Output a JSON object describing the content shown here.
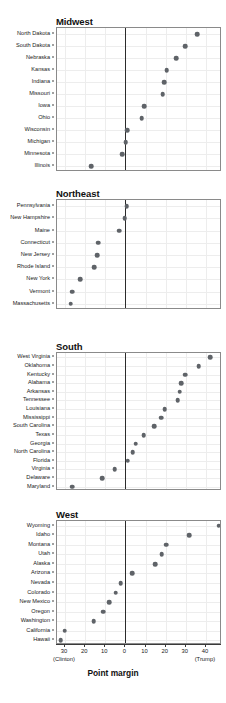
{
  "chart_data": {
    "type": "scatter",
    "title": "",
    "xlabel": "Point margin",
    "ylabel": "",
    "xlim": [
      -34,
      48
    ],
    "xticks": [
      -30,
      -20,
      -10,
      0,
      10,
      20,
      30,
      40
    ],
    "xticklabels": [
      "30",
      "20",
      "10",
      "0",
      "10",
      "20",
      "30",
      "40"
    ],
    "axis_end_labels": {
      "left": "(Clinton)",
      "right": "(Trump)"
    },
    "grid": true,
    "legend": "none",
    "zero_reference_line": 0,
    "note": "Negative values favor Clinton, positive values favor Trump",
    "panels": [
      {
        "name": "Midwest",
        "categories": [
          "North Dakota",
          "South Dakota",
          "Nebraska",
          "Kansas",
          "Indiana",
          "Missouri",
          "Iowa",
          "Ohio",
          "Wisconsin",
          "Michigan",
          "Minnesota",
          "Illinois"
        ],
        "values": [
          35.7,
          29.8,
          25.1,
          20.6,
          19.2,
          18.6,
          9.4,
          8.1,
          0.8,
          0.2,
          -1.5,
          -17.1
        ]
      },
      {
        "name": "Northeast",
        "categories": [
          "Pennsylvania",
          "New Hampshire",
          "Maine",
          "Connecticut",
          "New Jersey",
          "Rhode Island",
          "New York",
          "Vermont",
          "Massachusetts"
        ],
        "values": [
          0.7,
          -0.4,
          -3.0,
          -13.6,
          -14.1,
          -15.5,
          -22.5,
          -26.4,
          -27.2
        ]
      },
      {
        "name": "South",
        "categories": [
          "West Virginia",
          "Oklahoma",
          "Kentucky",
          "Alabama",
          "Arkansas",
          "Tennessee",
          "Louisiana",
          "Mississippi",
          "South Carolina",
          "Texas",
          "Georgia",
          "North Carolina",
          "Florida",
          "Virginia",
          "Delaware",
          "Maryland"
        ],
        "values": [
          42.2,
          36.4,
          29.8,
          27.7,
          26.9,
          26.0,
          19.6,
          17.8,
          14.3,
          9.0,
          5.1,
          3.7,
          1.2,
          -5.3,
          -11.4,
          -26.4
        ]
      },
      {
        "name": "West",
        "categories": [
          "Wyoming",
          "Idaho",
          "Montana",
          "Utah",
          "Alaska",
          "Arizona",
          "Nevada",
          "Colorado",
          "New Mexico",
          "Oregon",
          "Washington",
          "California",
          "Hawaii"
        ],
        "values": [
          46.3,
          31.8,
          20.4,
          18.1,
          14.7,
          3.5,
          -2.4,
          -4.9,
          -8.2,
          -11.0,
          -15.7,
          -30.1,
          -32.2
        ]
      }
    ]
  }
}
